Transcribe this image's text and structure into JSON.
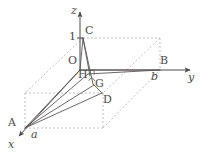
{
  "figure": {
    "type": "geometry-diagram-3d",
    "background_color": "#ffffff",
    "stroke_color": "#4a4a4a",
    "dashed_color": "#b0a9a9",
    "axes": [
      {
        "name": "z",
        "label": "z",
        "direction": "up"
      },
      {
        "name": "y",
        "label": "y",
        "direction": "right"
      },
      {
        "name": "x",
        "label": "x",
        "direction": "down-left"
      }
    ],
    "points": [
      {
        "id": "O",
        "label": "O",
        "x": 80,
        "y": 70,
        "lx": 69,
        "ly": 57
      },
      {
        "id": "C",
        "label": "C",
        "x": 83,
        "y": 38,
        "lx": 85,
        "ly": 26
      },
      {
        "id": "B",
        "label": "B",
        "x": 160,
        "y": 70,
        "lx": 161,
        "ly": 57
      },
      {
        "id": "A",
        "label": "A",
        "x": 25,
        "y": 128,
        "lx": 9,
        "ly": 118
      },
      {
        "id": "D",
        "label": "D",
        "x": 103,
        "y": 95,
        "lx": 104,
        "ly": 96
      },
      {
        "id": "G",
        "label": "G",
        "x": 93,
        "y": 83,
        "lx": 95,
        "ly": 77
      },
      {
        "id": "H",
        "label": "H",
        "x": 88,
        "y": 73,
        "lx": 78,
        "ly": 71
      }
    ],
    "tick_labels": [
      {
        "id": "one",
        "label": "1",
        "lx": 71,
        "ly": 30
      },
      {
        "id": "a",
        "label": "a",
        "lx": 31,
        "ly": 132
      },
      {
        "id": "b",
        "label": "b",
        "lx": 152,
        "ly": 73
      }
    ],
    "right_angle_marks": [
      {
        "at": "H",
        "note": "right angle at H"
      },
      {
        "at": "G",
        "note": "right angle at G"
      }
    ],
    "solid_edges": [
      "C-O",
      "C-H",
      "O-H",
      "O-B",
      "H-B",
      "A-H",
      "A-G",
      "A-D",
      "A-O"
    ],
    "dashed_edges": [
      "C-topright",
      "topright-B",
      "C-A",
      "A-box",
      "box-D",
      "D-B"
    ]
  }
}
